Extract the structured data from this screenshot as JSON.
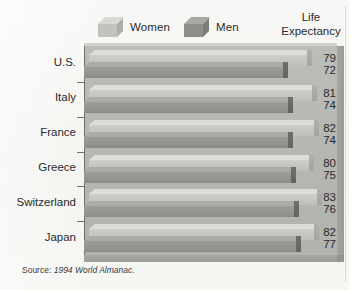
{
  "legend": {
    "items": [
      {
        "label": "Women",
        "key": "women",
        "swatch_color": "#c2c2be"
      },
      {
        "label": "Men",
        "key": "men",
        "swatch_color": "#8d8d8a"
      }
    ]
  },
  "header": {
    "line1": "Life",
    "line2": "Expectancy"
  },
  "source": {
    "prefix": "Source:",
    "text": "1994 World Almanac."
  },
  "chart_data": {
    "type": "bar",
    "orientation": "horizontal",
    "title": "Life Expectancy",
    "xlabel": "",
    "ylabel": "",
    "categories": [
      "U.S.",
      "Italy",
      "France",
      "Greece",
      "Switzerland",
      "Japan"
    ],
    "series": [
      {
        "name": "Women",
        "values": [
          79,
          81,
          82,
          80,
          83,
          82
        ],
        "color": "#c2c2be"
      },
      {
        "name": "Men",
        "values": [
          72,
          74,
          74,
          75,
          76,
          77
        ],
        "color": "#8d8d8a"
      }
    ],
    "value_unit": "years",
    "xlim": [
      0,
      90
    ],
    "grid": false,
    "legend_position": "top",
    "style": "3d-isometric",
    "annotations": [
      "Source: 1994 World Almanac."
    ]
  }
}
